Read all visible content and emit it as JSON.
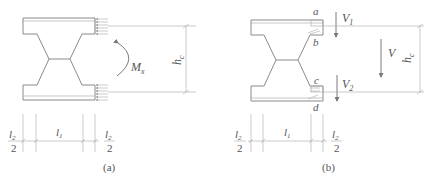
{
  "figure": {
    "panels": [
      {
        "id": "a",
        "caption": "(a)",
        "moment_label": "M",
        "moment_sub": "x",
        "height_label": "h",
        "height_sub": "c",
        "dims": {
          "left_num": "l",
          "left_num_sub": "2",
          "left_den": "2",
          "mid": "l",
          "mid_sub": "1",
          "right_num": "l",
          "right_num_sub": "2",
          "right_den": "2"
        }
      },
      {
        "id": "b",
        "caption": "(b)",
        "point_labels": [
          "a",
          "b",
          "c",
          "d"
        ],
        "shear_top": "V",
        "shear_top_sub": "1",
        "shear_total": "V",
        "shear_bottom": "V",
        "shear_bottom_sub": "2",
        "height_label": "h",
        "height_sub": "c",
        "dims": {
          "left_num": "l",
          "left_num_sub": "2",
          "left_den": "2",
          "mid": "l",
          "mid_sub": "1",
          "right_num": "l",
          "right_num_sub": "2",
          "right_den": "2"
        }
      }
    ],
    "colors": {
      "line": "#8a8a8a",
      "text": "#555555",
      "background": "#ffffff"
    }
  }
}
